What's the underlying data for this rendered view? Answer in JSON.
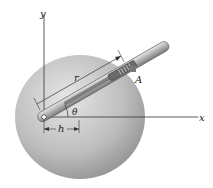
{
  "diagram": {
    "labels": {
      "y_axis": "y",
      "x_axis": "x",
      "radius": "r",
      "point": "A",
      "angle": "θ",
      "offset": "h"
    },
    "colors": {
      "disk_light": "#e4e4e4",
      "disk_dark": "#8d8d8d",
      "rod": "#b5b5b5",
      "lines": "#333333"
    }
  }
}
